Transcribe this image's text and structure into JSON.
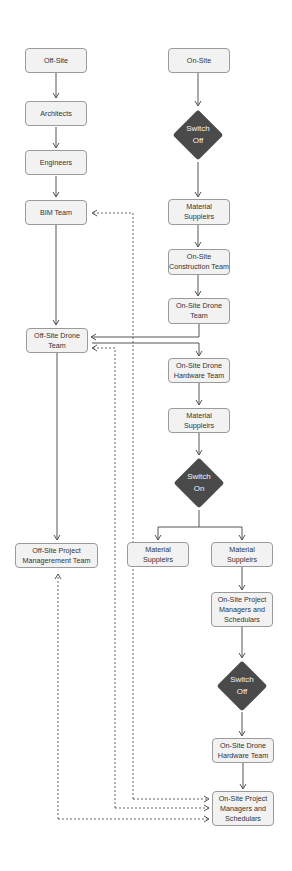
{
  "colors": {
    "node_fill": "#f2f2f2",
    "node_border": "#9a9a9a",
    "decision_fill": "#4a4a4a",
    "line": "#555555"
  },
  "nodes": {
    "off_site": "Off-Site",
    "architects": "Architects",
    "engineers": "Engineers",
    "bim_team": "BIM Team",
    "off_site_drone_team": "Off-Site Drone\nTeam",
    "off_site_pm_team": "Off-Site Project\nManagerement Team",
    "on_site": "On-Site",
    "switch_off_1": "Switch\nOff",
    "material_suppliers_1": "Material\nSuppleirs",
    "on_site_construction_team": "On-Site\nConstruction Team",
    "on_site_drone_team": "On-Site Drone\nTeam",
    "on_site_drone_hardware_team_1": "On-Site Drone\nHardware Team",
    "material_suppliers_2": "Material\nSuppleirs",
    "switch_on": "Switch\nOn",
    "material_suppliers_left": "Material\nSuppleirs",
    "material_suppliers_right": "Material\nSuppleirs",
    "on_site_pm_schedulers_1": "On-Site Project\nManagers and\nSchedulars",
    "switch_off_2": "Switch\nOff",
    "on_site_drone_hardware_team_2": "On-Site Drone\nHardware Team",
    "on_site_pm_schedulers_2": "On-Site Project\nManagers and\nSchedulars"
  }
}
